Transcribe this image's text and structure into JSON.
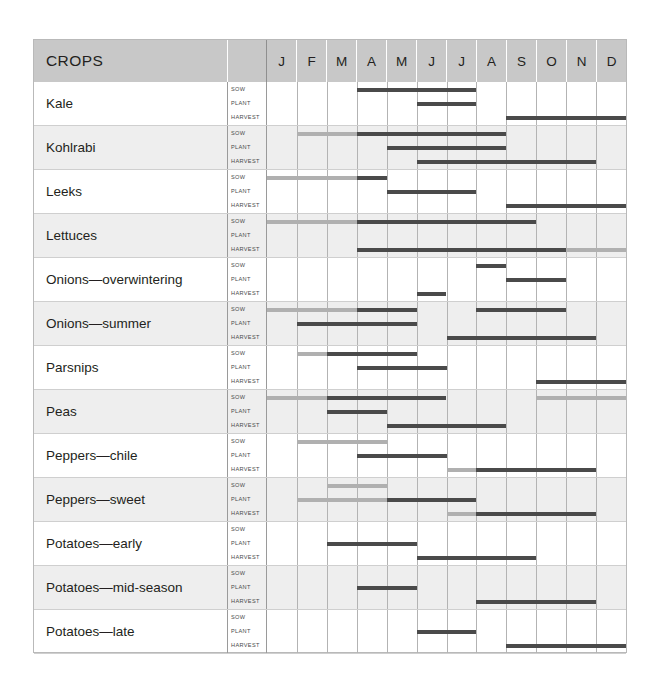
{
  "header": {
    "crops_label": "CROPS",
    "months": [
      "J",
      "F",
      "M",
      "A",
      "M",
      "J",
      "J",
      "A",
      "S",
      "O",
      "N",
      "D"
    ]
  },
  "stage_labels": {
    "sow": "SOW",
    "plant": "PLANT",
    "harvest": "HARVEST"
  },
  "colors": {
    "dark": "#4a4a4a",
    "light": "#b0b0b0",
    "header_bg": "#c8c8c8",
    "alt_row_bg": "#eeeeee"
  },
  "chart_data": {
    "type": "table",
    "xlabel": "Month",
    "ylabel": "Crop",
    "categories": [
      "J",
      "F",
      "M",
      "A",
      "M",
      "J",
      "J",
      "A",
      "S",
      "O",
      "N",
      "D"
    ],
    "stages": [
      "SOW",
      "PLANT",
      "HARVEST"
    ],
    "legend": [
      {
        "name": "primary period",
        "color": "#4a4a4a"
      },
      {
        "name": "secondary period",
        "color": "#b0b0b0"
      }
    ],
    "rows": [
      {
        "crop": "Kale",
        "bands": {
          "sow": [
            {
              "start": 3,
              "end": 6,
              "tone": "dark"
            }
          ],
          "plant": [
            {
              "start": 5,
              "end": 6,
              "tone": "dark"
            }
          ],
          "harvest": [
            {
              "start": 8,
              "end": 11,
              "tone": "dark"
            }
          ]
        }
      },
      {
        "crop": "Kohlrabi",
        "bands": {
          "sow": [
            {
              "start": 1,
              "end": 2,
              "tone": "light"
            },
            {
              "start": 3,
              "end": 7,
              "tone": "dark"
            }
          ],
          "plant": [
            {
              "start": 4,
              "end": 7,
              "tone": "dark"
            }
          ],
          "harvest": [
            {
              "start": 5,
              "end": 10,
              "tone": "dark"
            }
          ]
        }
      },
      {
        "crop": "Leeks",
        "bands": {
          "sow": [
            {
              "start": 0,
              "end": 2,
              "tone": "light"
            },
            {
              "start": 3,
              "end": 3,
              "tone": "dark"
            }
          ],
          "plant": [
            {
              "start": 4,
              "end": 6,
              "tone": "dark"
            }
          ],
          "harvest": [
            {
              "start": 8,
              "end": 11,
              "tone": "dark"
            }
          ]
        }
      },
      {
        "crop": "Lettuces",
        "bands": {
          "sow": [
            {
              "start": 0,
              "end": 2,
              "tone": "light"
            },
            {
              "start": 3,
              "end": 8,
              "tone": "dark"
            }
          ],
          "plant": [],
          "harvest": [
            {
              "start": 3,
              "end": 9,
              "tone": "dark"
            },
            {
              "start": 10,
              "end": 11,
              "tone": "light"
            }
          ]
        }
      },
      {
        "crop": "Onions—overwintering",
        "bands": {
          "sow": [
            {
              "start": 7,
              "end": 7,
              "tone": "dark"
            }
          ],
          "plant": [
            {
              "start": 8,
              "end": 9,
              "tone": "dark"
            }
          ],
          "harvest": [
            {
              "start": 5,
              "end": 5,
              "tone": "dark"
            }
          ]
        }
      },
      {
        "crop": "Onions—summer",
        "bands": {
          "sow": [
            {
              "start": 0,
              "end": 2,
              "tone": "light"
            },
            {
              "start": 3,
              "end": 4,
              "tone": "dark"
            },
            {
              "start": 7,
              "end": 9,
              "tone": "dark"
            }
          ],
          "plant": [
            {
              "start": 1,
              "end": 4,
              "tone": "dark"
            }
          ],
          "harvest": [
            {
              "start": 6,
              "end": 10,
              "tone": "dark"
            }
          ]
        }
      },
      {
        "crop": "Parsnips",
        "bands": {
          "sow": [
            {
              "start": 1,
              "end": 1,
              "tone": "light"
            },
            {
              "start": 2,
              "end": 4,
              "tone": "dark"
            }
          ],
          "plant": [
            {
              "start": 3,
              "end": 5,
              "tone": "dark"
            }
          ],
          "harvest": [
            {
              "start": 9,
              "end": 11,
              "tone": "dark"
            }
          ]
        }
      },
      {
        "crop": "Peas",
        "bands": {
          "sow": [
            {
              "start": 0,
              "end": 1,
              "tone": "light"
            },
            {
              "start": 2,
              "end": 5,
              "tone": "dark"
            },
            {
              "start": 9,
              "end": 11,
              "tone": "light"
            }
          ],
          "plant": [
            {
              "start": 2,
              "end": 3,
              "tone": "dark"
            }
          ],
          "harvest": [
            {
              "start": 4,
              "end": 7,
              "tone": "dark"
            }
          ]
        }
      },
      {
        "crop": "Peppers—chile",
        "bands": {
          "sow": [
            {
              "start": 1,
              "end": 3,
              "tone": "light"
            }
          ],
          "plant": [
            {
              "start": 3,
              "end": 5,
              "tone": "dark"
            }
          ],
          "harvest": [
            {
              "start": 6,
              "end": 6,
              "tone": "light"
            },
            {
              "start": 7,
              "end": 10,
              "tone": "dark"
            }
          ]
        }
      },
      {
        "crop": "Peppers—sweet",
        "bands": {
          "sow": [
            {
              "start": 2,
              "end": 3,
              "tone": "light"
            }
          ],
          "plant": [
            {
              "start": 1,
              "end": 3,
              "tone": "light"
            },
            {
              "start": 4,
              "end": 6,
              "tone": "dark"
            }
          ],
          "harvest": [
            {
              "start": 6,
              "end": 6,
              "tone": "light"
            },
            {
              "start": 7,
              "end": 10,
              "tone": "dark"
            }
          ]
        }
      },
      {
        "crop": "Potatoes—early",
        "bands": {
          "sow": [],
          "plant": [
            {
              "start": 2,
              "end": 4,
              "tone": "dark"
            }
          ],
          "harvest": [
            {
              "start": 5,
              "end": 8,
              "tone": "dark"
            }
          ]
        }
      },
      {
        "crop": "Potatoes—mid-season",
        "bands": {
          "sow": [],
          "plant": [
            {
              "start": 3,
              "end": 4,
              "tone": "dark"
            }
          ],
          "harvest": [
            {
              "start": 7,
              "end": 10,
              "tone": "dark"
            }
          ]
        }
      },
      {
        "crop": "Potatoes—late",
        "bands": {
          "sow": [],
          "plant": [
            {
              "start": 5,
              "end": 6,
              "tone": "dark"
            }
          ],
          "harvest": [
            {
              "start": 8,
              "end": 11,
              "tone": "dark"
            }
          ]
        }
      }
    ]
  }
}
